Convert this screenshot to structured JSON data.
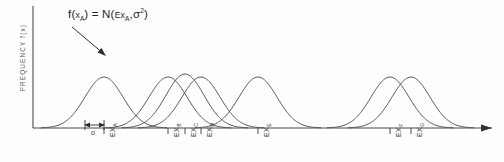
{
  "figure": {
    "title": "",
    "annotation": {
      "text_plain": "f(xA) = N(ExA, σ2)",
      "f_label": "f(",
      "f_var": "x",
      "f_sub": "A",
      "f_close": ")",
      "equals": "=",
      "dist": "N(",
      "e_cap": "E",
      "e_var": "x",
      "e_sub": "A",
      "comma": ",",
      "sigma": "σ",
      "sigma_exp": "2",
      "dist_close": ")"
    },
    "y_axis_label": "FREQUENCY   f(x)",
    "sigma_marker_label": "σ"
  },
  "chart_data": {
    "type": "line",
    "title": "",
    "subtitle": "",
    "xlabel": "",
    "ylabel": "FREQUENCY   f(x)",
    "grid": false,
    "legend_position": "none",
    "annotations": [
      {
        "text": "f(xA) = N(ExA, σ2)",
        "points_to": "EX_A",
        "x": 103,
        "y": 16
      },
      {
        "text": "σ",
        "type": "width-marker",
        "spans": "one standard deviation below EX_A"
      }
    ],
    "xlim": [
      0,
      1
    ],
    "ylim": [
      0,
      1
    ],
    "x_tick_labels": [
      "EX_A",
      "EX_B",
      "EX_C",
      "EX_D",
      "EX_E",
      "EX_F",
      "EX_G"
    ],
    "x_tick_positions": [
      104,
      168,
      185,
      201,
      258,
      390,
      411
    ],
    "series": [
      {
        "name": "f(x_A)",
        "mean_px": 104,
        "sigma_px": 19,
        "peak_px": 51,
        "label": "EX_A"
      },
      {
        "name": "f(x_B)",
        "mean_px": 168,
        "sigma_px": 19,
        "peak_px": 51,
        "label": "EX_B"
      },
      {
        "name": "f(x_C)",
        "mean_px": 185,
        "sigma_px": 19,
        "peak_px": 54,
        "label": "EX_C"
      },
      {
        "name": "f(x_D)",
        "mean_px": 201,
        "sigma_px": 19,
        "peak_px": 51,
        "label": "EX_D"
      },
      {
        "name": "f(x_E)",
        "mean_px": 258,
        "sigma_px": 19,
        "peak_px": 51,
        "label": "EX_E"
      },
      {
        "name": "f(x_F)",
        "mean_px": 390,
        "sigma_px": 19,
        "peak_px": 51,
        "label": "EX_F"
      },
      {
        "name": "f(x_G)",
        "mean_px": 411,
        "sigma_px": 19,
        "peak_px": 51,
        "label": "EX_G"
      }
    ],
    "ticks": [
      {
        "label_main": "EX",
        "label_sub": "A",
        "x": 104
      },
      {
        "label_main": "EX",
        "label_sub": "B",
        "x": 168
      },
      {
        "label_main": "EX",
        "label_sub": "C",
        "x": 185
      },
      {
        "label_main": "EX",
        "label_sub": "D",
        "x": 201
      },
      {
        "label_main": "EX",
        "label_sub": "E",
        "x": 258
      },
      {
        "label_main": "EX",
        "label_sub": "F",
        "x": 390
      },
      {
        "label_main": "EX",
        "label_sub": "G",
        "x": 411
      }
    ],
    "colors": {
      "curve": "#3b3b3b",
      "axis": "#4a4a4a",
      "text": "#2e2e2e",
      "background": "#fefefe"
    }
  }
}
